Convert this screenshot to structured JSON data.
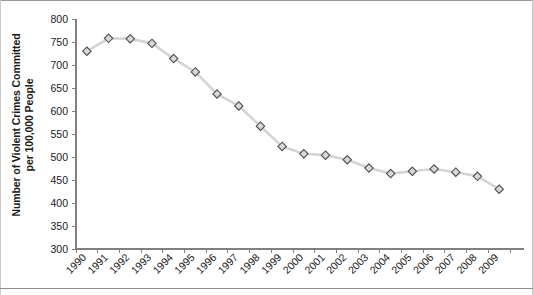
{
  "chart_data": {
    "type": "line",
    "title": "",
    "xlabel": "",
    "ylabel": "Number of Violent Crimes Committed per 100,000 People",
    "ylabel_lines": [
      "Number of Violent Crimes Committed",
      "per 100,000 People"
    ],
    "categories": [
      "1990",
      "1991",
      "1992",
      "1993",
      "1994",
      "1995",
      "1996",
      "1997",
      "1998",
      "1999",
      "2000",
      "2001",
      "2002",
      "2003",
      "2004",
      "2005",
      "2006",
      "2007",
      "2008",
      "2009"
    ],
    "values": [
      730,
      758,
      757,
      747,
      714,
      685,
      637,
      611,
      567,
      523,
      507,
      504,
      494,
      476,
      464,
      469,
      474,
      467,
      458,
      430
    ],
    "ylim": [
      300,
      800
    ],
    "ytick_step": 50,
    "yticks": [
      "300",
      "350",
      "400",
      "450",
      "500",
      "550",
      "600",
      "650",
      "700",
      "750",
      "800"
    ],
    "grid": false,
    "legend": "none",
    "marker": "diamond",
    "colors": {
      "line": "#d4d4d4",
      "marker_fill": "#d9d9d9",
      "marker_stroke": "#4d4d4d",
      "axis": "#808080",
      "text": "#1a1a1a",
      "background": "#ffffff"
    }
  }
}
